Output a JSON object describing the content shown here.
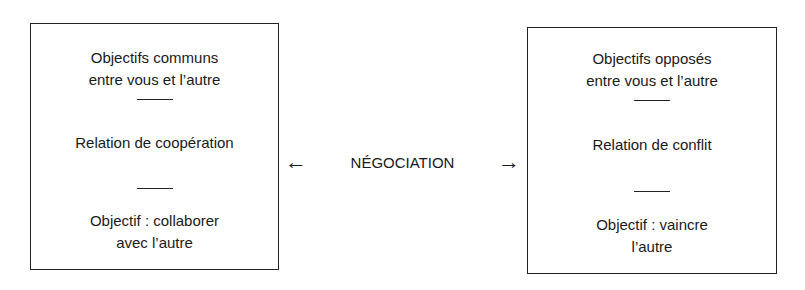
{
  "left_box": {
    "heading_line1": "Objectifs communs",
    "heading_line2": "entre vous et l’autre",
    "relation": "Relation de coopération",
    "goal_line1": "Objectif : collaborer",
    "goal_line2": "avec l’autre"
  },
  "right_box": {
    "heading_line1": "Objectifs opposés",
    "heading_line2": "entre vous et l’autre",
    "relation": "Relation de conflit",
    "goal_line1": "Objectif : vaincre",
    "goal_line2": "l’autre"
  },
  "center": {
    "label": "NÉGOCIATION",
    "left_arrow": "←",
    "right_arrow": "→"
  }
}
